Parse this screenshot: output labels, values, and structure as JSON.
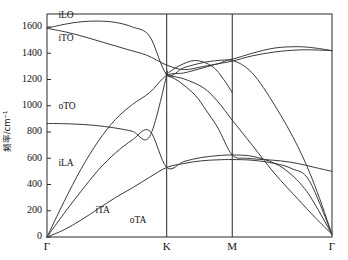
{
  "chart_data": {
    "type": "line",
    "title": "",
    "xlabel": "",
    "ylabel": "频率/cm⁻¹",
    "ylim": [
      0,
      1700
    ],
    "yticks": [
      0,
      200,
      400,
      600,
      800,
      1000,
      1200,
      1400,
      1600
    ],
    "ytick_labels": [
      "0",
      "200",
      "400",
      "600",
      "800",
      "1000",
      "1200",
      "1400",
      "1600"
    ],
    "grid": false,
    "legend": "inline-annotations",
    "high_symmetry_points": [
      "Γ",
      "K",
      "M",
      "Γ"
    ],
    "high_symmetry_x": [
      0.0,
      0.42,
      0.65,
      1.0
    ],
    "annotations": [
      {
        "text": "iLO",
        "x": 0.04,
        "y": 1670
      },
      {
        "text": "iTO",
        "x": 0.04,
        "y": 1490
      },
      {
        "text": "oTO",
        "x": 0.04,
        "y": 975
      },
      {
        "text": "iLA",
        "x": 0.04,
        "y": 540
      },
      {
        "text": "iTA",
        "x": 0.17,
        "y": 185
      },
      {
        "text": "oTA",
        "x": 0.29,
        "y": 105
      }
    ],
    "series": [
      {
        "name": "iLO",
        "points": [
          [
            0.0,
            1590
          ],
          [
            0.06,
            1620
          ],
          [
            0.12,
            1640
          ],
          [
            0.18,
            1645
          ],
          [
            0.24,
            1635
          ],
          [
            0.3,
            1600
          ],
          [
            0.36,
            1530
          ],
          [
            0.42,
            1240
          ],
          [
            0.48,
            1290
          ],
          [
            0.55,
            1330
          ],
          [
            0.6,
            1345
          ],
          [
            0.65,
            1355
          ],
          [
            0.72,
            1400
          ],
          [
            0.8,
            1440
          ],
          [
            0.88,
            1450
          ],
          [
            0.94,
            1440
          ],
          [
            1.0,
            1420
          ]
        ]
      },
      {
        "name": "iTO",
        "points": [
          [
            0.0,
            1590
          ],
          [
            0.07,
            1560
          ],
          [
            0.14,
            1520
          ],
          [
            0.21,
            1475
          ],
          [
            0.28,
            1430
          ],
          [
            0.35,
            1385
          ],
          [
            0.42,
            1310
          ],
          [
            0.48,
            1275
          ],
          [
            0.55,
            1300
          ],
          [
            0.6,
            1320
          ],
          [
            0.65,
            1340
          ],
          [
            0.72,
            1380
          ],
          [
            0.8,
            1410
          ],
          [
            0.88,
            1425
          ],
          [
            0.94,
            1425
          ],
          [
            1.0,
            1420
          ]
        ]
      },
      {
        "name": "oTO",
        "points": [
          [
            0.0,
            865
          ],
          [
            0.08,
            862
          ],
          [
            0.16,
            852
          ],
          [
            0.24,
            830
          ],
          [
            0.3,
            805
          ],
          [
            0.36,
            765
          ],
          [
            0.42,
            1230
          ],
          [
            0.42,
            1230
          ],
          [
            0.48,
            1205
          ],
          [
            0.55,
            1135
          ],
          [
            0.6,
            1030
          ],
          [
            0.65,
            890
          ],
          [
            0.72,
            700
          ],
          [
            0.8,
            480
          ],
          [
            0.88,
            290
          ],
          [
            0.94,
            150
          ],
          [
            1.0,
            20
          ]
        ]
      },
      {
        "name": "oTO-lower-branch",
        "points": [
          [
            0.42,
            1230
          ],
          [
            0.46,
            1190
          ],
          [
            0.52,
            1080
          ],
          [
            0.56,
            960
          ],
          [
            0.6,
            830
          ],
          [
            0.65,
            625
          ],
          [
            0.7,
            600
          ],
          [
            0.76,
            590
          ],
          [
            0.82,
            580
          ],
          [
            0.88,
            560
          ],
          [
            0.94,
            530
          ],
          [
            1.0,
            500
          ]
        ]
      },
      {
        "name": "iLA",
        "points": [
          [
            0.0,
            0
          ],
          [
            0.06,
            270
          ],
          [
            0.12,
            520
          ],
          [
            0.18,
            730
          ],
          [
            0.24,
            895
          ],
          [
            0.3,
            1010
          ],
          [
            0.36,
            1100
          ],
          [
            0.42,
            1230
          ],
          [
            0.48,
            1250
          ],
          [
            0.55,
            1290
          ],
          [
            0.6,
            1320
          ],
          [
            0.65,
            1345
          ],
          [
            0.72,
            1250
          ],
          [
            0.8,
            1000
          ],
          [
            0.88,
            690
          ],
          [
            0.94,
            390
          ],
          [
            1.0,
            20
          ]
        ]
      },
      {
        "name": "iTA",
        "points": [
          [
            0.0,
            0
          ],
          [
            0.06,
            180
          ],
          [
            0.12,
            350
          ],
          [
            0.18,
            510
          ],
          [
            0.24,
            640
          ],
          [
            0.3,
            740
          ],
          [
            0.36,
            810
          ],
          [
            0.42,
            530
          ],
          [
            0.48,
            575
          ],
          [
            0.54,
            605
          ],
          [
            0.6,
            620
          ],
          [
            0.65,
            625
          ],
          [
            0.72,
            615
          ],
          [
            0.8,
            560
          ],
          [
            0.86,
            470
          ],
          [
            0.92,
            320
          ],
          [
            1.0,
            20
          ]
        ]
      },
      {
        "name": "oTA",
        "points": [
          [
            0.0,
            0
          ],
          [
            0.06,
            55
          ],
          [
            0.12,
            130
          ],
          [
            0.18,
            215
          ],
          [
            0.24,
            300
          ],
          [
            0.3,
            375
          ],
          [
            0.36,
            455
          ],
          [
            0.42,
            530
          ],
          [
            0.48,
            560
          ],
          [
            0.54,
            580
          ],
          [
            0.6,
            588
          ],
          [
            0.65,
            590
          ],
          [
            0.72,
            585
          ],
          [
            0.8,
            560
          ],
          [
            0.86,
            520
          ],
          [
            0.92,
            430
          ],
          [
            1.0,
            20
          ]
        ]
      },
      {
        "name": "iLA-upper-continuation",
        "points": [
          [
            0.42,
            1240
          ],
          [
            0.46,
            1300
          ],
          [
            0.52,
            1345
          ],
          [
            0.58,
            1300
          ],
          [
            0.62,
            1200
          ],
          [
            0.65,
            1100
          ]
        ]
      }
    ]
  },
  "axes": {
    "y_axis_title": "频率/cm⁻¹"
  }
}
